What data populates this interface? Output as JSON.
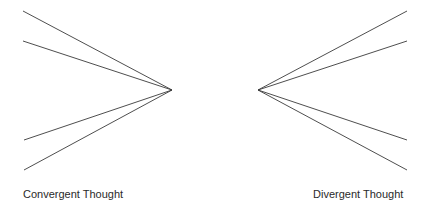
{
  "diagram": {
    "line_color": "#3a3a3a",
    "convergent": {
      "label": "Convergent Thought",
      "focal_point": [
        172,
        90
      ],
      "line_ends": [
        [
          23,
          11
        ],
        [
          23,
          41
        ],
        [
          24,
          140
        ],
        [
          24,
          170
        ]
      ]
    },
    "divergent": {
      "label": "Divergent Thought",
      "focal_point": [
        258,
        90
      ],
      "line_ends": [
        [
          407,
          11
        ],
        [
          407,
          41
        ],
        [
          407,
          140
        ],
        [
          407,
          170
        ]
      ]
    }
  }
}
